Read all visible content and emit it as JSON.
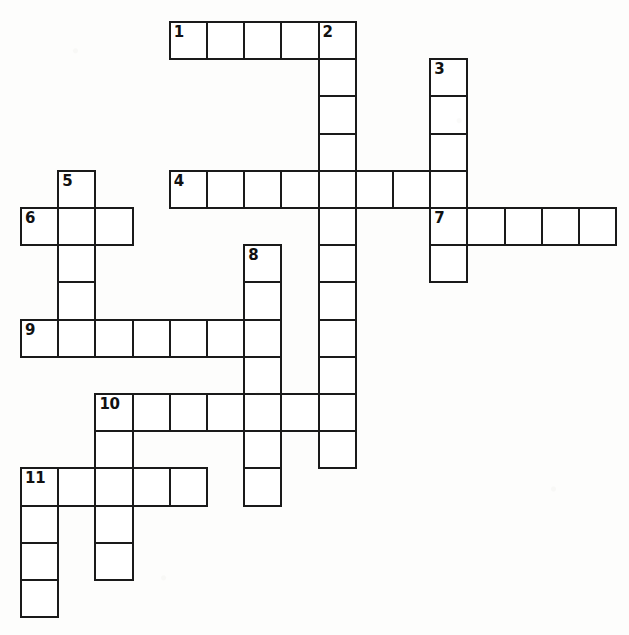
{
  "puzzle": {
    "type": "crossword-grid",
    "title": "Crossword Puzzle Grid",
    "background_color": "#fdfdfc",
    "cell_fill_color": "#ffffff",
    "cell_border_color": "#1a1a1a",
    "number_color": "#111111",
    "cell_size_px": 37.2,
    "origin_x_px": 20,
    "origin_y_px": 21,
    "columns": 16,
    "rows": 16,
    "total_entries": 11,
    "clue_numbers": [
      "1",
      "2",
      "3",
      "4",
      "5",
      "6",
      "7",
      "8",
      "9",
      "10",
      "11"
    ],
    "entries": [
      {
        "number": "1",
        "direction": "across",
        "row": 0,
        "col": 4,
        "length": 5
      },
      {
        "number": "2",
        "direction": "down",
        "row": 0,
        "col": 8,
        "length": 12
      },
      {
        "number": "3",
        "direction": "down",
        "row": 1,
        "col": 11,
        "length": 6
      },
      {
        "number": "4",
        "direction": "across",
        "row": 4,
        "col": 4,
        "length": 8
      },
      {
        "number": "5",
        "direction": "down",
        "row": 4,
        "col": 1,
        "length": 5
      },
      {
        "number": "6",
        "direction": "across",
        "row": 5,
        "col": 0,
        "length": 3
      },
      {
        "number": "7",
        "direction": "across",
        "row": 5,
        "col": 11,
        "length": 5
      },
      {
        "number": "8",
        "direction": "down",
        "row": 6,
        "col": 6,
        "length": 7
      },
      {
        "number": "9",
        "direction": "across",
        "row": 8,
        "col": 0,
        "length": 7
      },
      {
        "number": "10",
        "direction": "across",
        "row": 10,
        "col": 2,
        "length": 7
      },
      {
        "number": "10",
        "direction": "down",
        "row": 10,
        "col": 2,
        "length": 5
      },
      {
        "number": "11",
        "direction": "across",
        "row": 12,
        "col": 0,
        "length": 5
      },
      {
        "number": "11",
        "direction": "down",
        "row": 12,
        "col": 0,
        "length": 4
      }
    ],
    "cells": [
      {
        "row": 0,
        "col": 4,
        "number": "1"
      },
      {
        "row": 0,
        "col": 5,
        "number": ""
      },
      {
        "row": 0,
        "col": 6,
        "number": ""
      },
      {
        "row": 0,
        "col": 7,
        "number": ""
      },
      {
        "row": 0,
        "col": 8,
        "number": "2"
      },
      {
        "row": 1,
        "col": 8,
        "number": ""
      },
      {
        "row": 1,
        "col": 11,
        "number": "3"
      },
      {
        "row": 2,
        "col": 8,
        "number": ""
      },
      {
        "row": 2,
        "col": 11,
        "number": ""
      },
      {
        "row": 3,
        "col": 8,
        "number": ""
      },
      {
        "row": 3,
        "col": 11,
        "number": ""
      },
      {
        "row": 4,
        "col": 1,
        "number": "5"
      },
      {
        "row": 4,
        "col": 4,
        "number": "4"
      },
      {
        "row": 4,
        "col": 5,
        "number": ""
      },
      {
        "row": 4,
        "col": 6,
        "number": ""
      },
      {
        "row": 4,
        "col": 7,
        "number": ""
      },
      {
        "row": 4,
        "col": 8,
        "number": ""
      },
      {
        "row": 4,
        "col": 9,
        "number": ""
      },
      {
        "row": 4,
        "col": 10,
        "number": ""
      },
      {
        "row": 4,
        "col": 11,
        "number": ""
      },
      {
        "row": 5,
        "col": 0,
        "number": "6"
      },
      {
        "row": 5,
        "col": 1,
        "number": ""
      },
      {
        "row": 5,
        "col": 2,
        "number": ""
      },
      {
        "row": 5,
        "col": 8,
        "number": ""
      },
      {
        "row": 5,
        "col": 11,
        "number": "7"
      },
      {
        "row": 5,
        "col": 12,
        "number": ""
      },
      {
        "row": 5,
        "col": 13,
        "number": ""
      },
      {
        "row": 5,
        "col": 14,
        "number": ""
      },
      {
        "row": 5,
        "col": 15,
        "number": ""
      },
      {
        "row": 6,
        "col": 1,
        "number": ""
      },
      {
        "row": 6,
        "col": 6,
        "number": "8"
      },
      {
        "row": 6,
        "col": 8,
        "number": ""
      },
      {
        "row": 6,
        "col": 11,
        "number": ""
      },
      {
        "row": 7,
        "col": 1,
        "number": ""
      },
      {
        "row": 7,
        "col": 6,
        "number": ""
      },
      {
        "row": 7,
        "col": 8,
        "number": ""
      },
      {
        "row": 8,
        "col": 0,
        "number": "9"
      },
      {
        "row": 8,
        "col": 1,
        "number": ""
      },
      {
        "row": 8,
        "col": 2,
        "number": ""
      },
      {
        "row": 8,
        "col": 3,
        "number": ""
      },
      {
        "row": 8,
        "col": 4,
        "number": ""
      },
      {
        "row": 8,
        "col": 5,
        "number": ""
      },
      {
        "row": 8,
        "col": 6,
        "number": ""
      },
      {
        "row": 8,
        "col": 8,
        "number": ""
      },
      {
        "row": 9,
        "col": 6,
        "number": ""
      },
      {
        "row": 9,
        "col": 8,
        "number": ""
      },
      {
        "row": 10,
        "col": 2,
        "number": "10"
      },
      {
        "row": 10,
        "col": 3,
        "number": ""
      },
      {
        "row": 10,
        "col": 4,
        "number": ""
      },
      {
        "row": 10,
        "col": 5,
        "number": ""
      },
      {
        "row": 10,
        "col": 6,
        "number": ""
      },
      {
        "row": 10,
        "col": 7,
        "number": ""
      },
      {
        "row": 10,
        "col": 8,
        "number": ""
      },
      {
        "row": 11,
        "col": 2,
        "number": ""
      },
      {
        "row": 11,
        "col": 6,
        "number": ""
      },
      {
        "row": 11,
        "col": 8,
        "number": ""
      },
      {
        "row": 12,
        "col": 0,
        "number": "11"
      },
      {
        "row": 12,
        "col": 1,
        "number": ""
      },
      {
        "row": 12,
        "col": 2,
        "number": ""
      },
      {
        "row": 12,
        "col": 3,
        "number": ""
      },
      {
        "row": 12,
        "col": 4,
        "number": ""
      },
      {
        "row": 12,
        "col": 6,
        "number": ""
      },
      {
        "row": 13,
        "col": 0,
        "number": ""
      },
      {
        "row": 13,
        "col": 2,
        "number": ""
      },
      {
        "row": 14,
        "col": 0,
        "number": ""
      },
      {
        "row": 14,
        "col": 2,
        "number": ""
      },
      {
        "row": 15,
        "col": 0,
        "number": ""
      }
    ]
  }
}
